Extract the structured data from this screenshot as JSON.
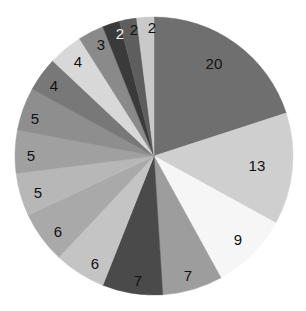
{
  "chart_data": {
    "type": "pie",
    "title": "",
    "subtitle": "",
    "xlabel": "",
    "ylabel": "",
    "legend": "none",
    "grid": false,
    "start_angle_deg": 0,
    "direction": "clockwise",
    "total": 100,
    "labels_shown": true,
    "background_color": "#ffffff",
    "center": {
      "x": 154,
      "y": 156
    },
    "radius": 139,
    "categories": [
      "slice-20",
      "slice-13",
      "slice-9",
      "slice-7a",
      "slice-7b",
      "slice-6a",
      "slice-6b",
      "slice-5a",
      "slice-5b",
      "slice-5c",
      "slice-4a",
      "slice-4b",
      "slice-3",
      "slice-2a",
      "slice-2b",
      "slice-2c"
    ],
    "values": [
      20,
      13,
      9,
      7,
      7,
      6,
      6,
      5,
      5,
      5,
      4,
      4,
      3,
      2,
      2,
      2
    ],
    "value_labels": [
      "20",
      "13",
      "9",
      "7",
      "7",
      "6",
      "6",
      "5",
      "5",
      "5",
      "4",
      "4",
      "3",
      "2",
      "2",
      "2"
    ],
    "colors": [
      "#6f6f6f",
      "#cfcfcf",
      "#f6f6f6",
      "#9d9d9d",
      "#4a4a4a",
      "#c4c4c4",
      "#a9a9a9",
      "#b7b7b7",
      "#a0a0a0",
      "#8e8e8e",
      "#787878",
      "#d8d8d8",
      "#8a8a8a",
      "#3a3a3a",
      "#5e5e5e",
      "#c9c9c9"
    ],
    "label_text_colors": [
      "#111111",
      "#111111",
      "#111111",
      "#111111",
      "#111111",
      "#111111",
      "#111111",
      "#111111",
      "#111111",
      "#111111",
      "#111111",
      "#111111",
      "#111111",
      "#f2f2f2",
      "#111111",
      "#111111"
    ],
    "label_positions": [
      {
        "x": 214,
        "y": 63
      },
      {
        "x": 257,
        "y": 165
      },
      {
        "x": 238,
        "y": 239
      },
      {
        "x": 188,
        "y": 275
      },
      {
        "x": 138,
        "y": 280
      },
      {
        "x": 95,
        "y": 263
      },
      {
        "x": 58,
        "y": 231
      },
      {
        "x": 38,
        "y": 192
      },
      {
        "x": 31,
        "y": 155
      },
      {
        "x": 35,
        "y": 118
      },
      {
        "x": 54,
        "y": 85
      },
      {
        "x": 78,
        "y": 61
      },
      {
        "x": 101,
        "y": 44
      },
      {
        "x": 120,
        "y": 33
      },
      {
        "x": 134,
        "y": 29
      },
      {
        "x": 152,
        "y": 27
      }
    ]
  }
}
